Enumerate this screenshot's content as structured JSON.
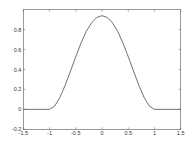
{
  "chart_data": {
    "type": "line",
    "title": "",
    "xlabel": "",
    "ylabel": "",
    "xlim": [
      -1.5,
      1.5
    ],
    "ylim": [
      -0.2,
      1.0
    ],
    "xticks": [
      -1.5,
      -1,
      -0.5,
      0,
      0.5,
      1,
      1.5
    ],
    "xtick_labels": [
      "-1.5",
      "-1",
      "-0.5",
      "0",
      "0.5",
      "1",
      "1.5"
    ],
    "yticks": [
      -0.2,
      0,
      0.2,
      0.4,
      0.6,
      0.8
    ],
    "ytick_labels": [
      "-0.2",
      "0",
      "0.2",
      "0.4",
      "0.6",
      "0.8"
    ],
    "grid": false,
    "legend": null,
    "box": true,
    "series": [
      {
        "name": "bump",
        "color": "#333333",
        "x": [
          -1.5,
          -1.25,
          -1.0,
          -0.9,
          -0.8,
          -0.7,
          -0.6,
          -0.5,
          -0.4,
          -0.3,
          -0.2,
          -0.1,
          0.0,
          0.1,
          0.2,
          0.3,
          0.4,
          0.5,
          0.6,
          0.7,
          0.8,
          0.9,
          1.0,
          1.25,
          1.5
        ],
        "y": [
          0.0,
          0.0,
          0.0,
          0.034,
          0.122,
          0.245,
          0.385,
          0.529,
          0.665,
          0.782,
          0.868,
          0.922,
          0.94,
          0.922,
          0.868,
          0.782,
          0.665,
          0.529,
          0.385,
          0.245,
          0.122,
          0.034,
          0.0,
          0.0,
          0.0
        ]
      }
    ]
  }
}
